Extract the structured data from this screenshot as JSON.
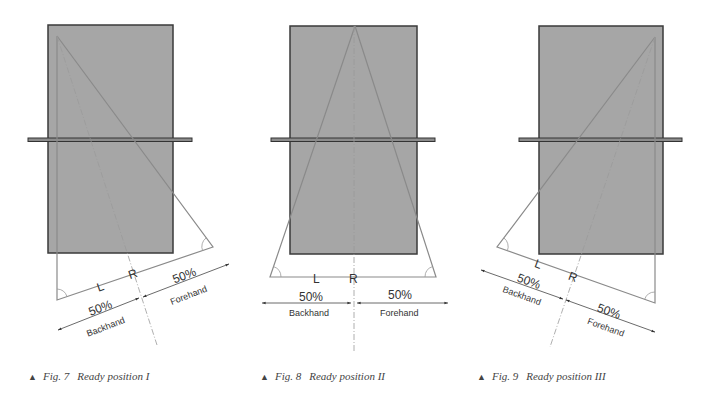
{
  "figures": [
    {
      "id": "fig7",
      "caption_number": "Fig. 7",
      "caption_title": "Ready position I",
      "left_label": "L",
      "right_label": "R",
      "backhand_percent": "50%",
      "backhand_label": "Backhand",
      "forehand_percent": "50%",
      "forehand_label": "Forehand"
    },
    {
      "id": "fig8",
      "caption_number": "Fig. 8",
      "caption_title": "Ready position II",
      "left_label": "L",
      "right_label": "R",
      "backhand_percent": "50%",
      "backhand_label": "Backhand",
      "forehand_percent": "50%",
      "forehand_label": "Forehand"
    },
    {
      "id": "fig9",
      "caption_number": "Fig. 9",
      "caption_title": "Ready position III",
      "left_label": "L",
      "right_label": "R",
      "backhand_percent": "50%",
      "backhand_label": "Backhand",
      "forehand_percent": "50%",
      "forehand_label": "Forehand"
    }
  ],
  "colors": {
    "table_fill": "#a6a6a6",
    "table_stroke": "#3a3a3a",
    "line": "#8a8a8a",
    "text": "#333333"
  },
  "caption_marker": "▲"
}
